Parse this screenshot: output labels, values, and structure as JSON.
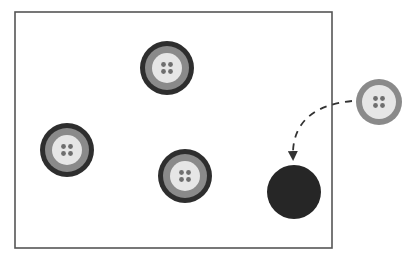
{
  "diagram": {
    "frame": {
      "x": 15,
      "y": 12,
      "width": 317,
      "height": 236,
      "stroke": "#555555"
    },
    "colors": {
      "outer_ring": "#2e2e2e",
      "middle_ring": "#8a8a8a",
      "face": "#e6e6e6",
      "holes": "#6e6e6e",
      "hole_target": "#262626",
      "arrow": "#333333"
    },
    "buttons_inside": [
      {
        "id": "button-top",
        "cx": 167,
        "cy": 68,
        "r": 27
      },
      {
        "id": "button-left",
        "cx": 67,
        "cy": 150,
        "r": 27
      },
      {
        "id": "button-middle",
        "cx": 185,
        "cy": 176,
        "r": 27
      }
    ],
    "button_outside": {
      "id": "button-moving",
      "cx": 379,
      "cy": 102,
      "r": 23
    },
    "target_hole": {
      "cx": 294,
      "cy": 192,
      "r": 27
    },
    "arrow": {
      "style": "dashed",
      "from": [
        352,
        101
      ],
      "to": [
        293,
        158
      ]
    }
  }
}
